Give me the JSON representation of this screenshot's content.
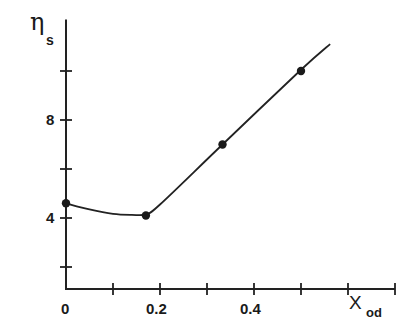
{
  "chart_data": {
    "type": "line",
    "title": "",
    "xlabel": "X_od",
    "ylabel": "η_s",
    "xlabel_main": "X",
    "xlabel_sub": "od",
    "ylabel_main": "η",
    "ylabel_sub": "s",
    "x_ticks": [
      0.1,
      0.2,
      0.3,
      0.4,
      0.5,
      0.6,
      0.7
    ],
    "x_tick_labels": [
      {
        "value": 0,
        "label": "0"
      },
      {
        "value": 0.2,
        "label": "0.2"
      },
      {
        "value": 0.4,
        "label": "0.4"
      }
    ],
    "y_ticks": [
      2,
      4,
      6,
      8,
      10
    ],
    "y_tick_labels": [
      {
        "value": 4,
        "label": "4"
      },
      {
        "value": 8,
        "label": "8"
      }
    ],
    "xlim": [
      0,
      0.7
    ],
    "ylim": [
      1.1,
      12.1
    ],
    "grid": false,
    "legend": null,
    "series": [
      {
        "name": "measured",
        "points": [
          {
            "x": 0.0,
            "y": 4.6
          },
          {
            "x": 0.17,
            "y": 4.1
          },
          {
            "x": 0.333,
            "y": 7.0
          },
          {
            "x": 0.5,
            "y": 10.0
          }
        ]
      }
    ],
    "fit_curve": {
      "description": "smooth curve with minimum near x=0.13 then linear rise",
      "points": [
        {
          "x": 0.0,
          "y": 4.6
        },
        {
          "x": 0.05,
          "y": 4.35
        },
        {
          "x": 0.1,
          "y": 4.17
        },
        {
          "x": 0.14,
          "y": 4.13
        },
        {
          "x": 0.17,
          "y": 4.15
        },
        {
          "x": 0.2,
          "y": 4.55
        },
        {
          "x": 0.333,
          "y": 7.0
        },
        {
          "x": 0.5,
          "y": 10.05
        },
        {
          "x": 0.562,
          "y": 11.1
        }
      ]
    }
  }
}
